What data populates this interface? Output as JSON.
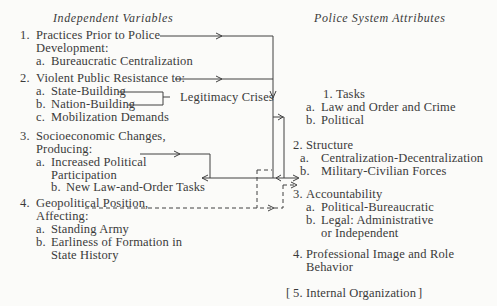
{
  "headers": {
    "left": "Independent Variables",
    "right": "Police System Attributes"
  },
  "independent": [
    {
      "num": "1.",
      "lines": [
        "Practices Prior to Police",
        "Development:"
      ],
      "sub": [
        {
          "label": "a.",
          "text": [
            "Bureaucratic Centralization"
          ]
        }
      ]
    },
    {
      "num": "2.",
      "lines": [
        "Violent Public Resistance to:"
      ],
      "sub": [
        {
          "label": "a.",
          "text": [
            "State-Building"
          ]
        },
        {
          "label": "b.",
          "text": [
            "Nation-Building"
          ]
        },
        {
          "label": "c.",
          "text": [
            "Mobilization Demands"
          ]
        }
      ]
    },
    {
      "num": "3.",
      "lines": [
        "Socioeconomic Changes,",
        "Producing:"
      ],
      "sub": [
        {
          "label": "a.",
          "text": [
            "Increased Political",
            "Participation"
          ]
        },
        {
          "label": "b.",
          "text": [
            "New Law-and-Order Tasks"
          ]
        }
      ]
    },
    {
      "num": "4.",
      "lines": [
        "Geopolitical Position,",
        "Affecting:"
      ],
      "sub": [
        {
          "label": "a.",
          "text": [
            "Standing Army"
          ]
        },
        {
          "label": "b.",
          "text": [
            "Earliness of Formation in",
            "State History"
          ]
        }
      ]
    }
  ],
  "bracket_label": "Legitimacy Crises",
  "attributes": [
    {
      "num": "1.",
      "lines": [
        "Tasks"
      ],
      "sub": [
        {
          "label": "a.",
          "text": [
            "Law and Order and Crime"
          ]
        },
        {
          "label": "b.",
          "text": [
            "Political"
          ]
        }
      ]
    },
    {
      "num": "2.",
      "lines": [
        "Structure"
      ],
      "sub": [
        {
          "label": "a.",
          "text": [
            "Centralization-Decentralization"
          ]
        },
        {
          "label": "b.",
          "text": [
            "Military-Civilian Forces"
          ]
        }
      ]
    },
    {
      "num": "3.",
      "lines": [
        "Accountability"
      ],
      "sub": [
        {
          "label": "a.",
          "text": [
            "Political-Bureaucratic"
          ]
        },
        {
          "label": "b.",
          "text": [
            "Legal: Administrative",
            "or Independent"
          ]
        }
      ]
    },
    {
      "num": "4.",
      "lines": [
        "Professional Image and Role",
        "Behavior"
      ],
      "sub": []
    },
    {
      "num": "5.",
      "lines": [
        "Internal Organization"
      ],
      "bracketed": true,
      "sub": []
    }
  ],
  "colors": {
    "ink": "#3a3a3a",
    "paper": "#fbfbf9"
  }
}
